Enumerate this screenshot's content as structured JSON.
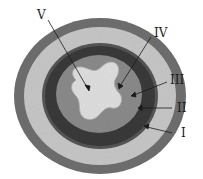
{
  "diagram": {
    "type": "concentric-cross-section",
    "layers": [
      {
        "id": "I",
        "label": "I",
        "color": "#6e6e6e",
        "description": "outermost dark ring"
      },
      {
        "id": "II",
        "label": "II",
        "color": "#c4c4c4",
        "description": "light ring"
      },
      {
        "id": "III",
        "label": "III",
        "color": "#3e3e3e",
        "description": "dark ring"
      },
      {
        "id": "IV",
        "label": "IV",
        "color": "#8a8a8a",
        "description": "medium inner ring"
      },
      {
        "id": "V",
        "label": "V",
        "color": "#d9d9d9",
        "description": "central cross-shaped lumen"
      }
    ],
    "labels": {
      "v": "V",
      "iv": "IV",
      "iii": "III",
      "ii": "II",
      "i": "I"
    }
  }
}
